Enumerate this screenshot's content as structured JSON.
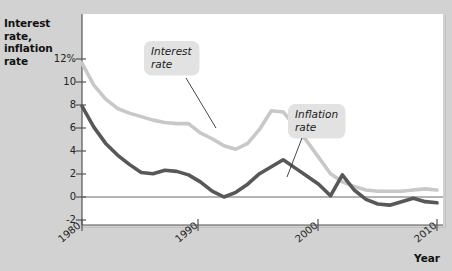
{
  "figure": {
    "y_axis_title_line1": "Interest rate,",
    "y_axis_title_line2": "inflation rate",
    "x_axis_title": "Year"
  },
  "callouts": {
    "interest": {
      "line1": "Interest",
      "line2": "rate"
    },
    "inflation": {
      "line1": "Inflation",
      "line2": "rate"
    }
  },
  "ticks": {
    "y": [
      "12%",
      "10",
      "8",
      "6",
      "4",
      "2",
      "0",
      "-2"
    ],
    "x": [
      "1980",
      "1990",
      "2000",
      "2010"
    ]
  },
  "colors": {
    "interest_rate_line": "#c8c8c8",
    "inflation_rate_line": "#585858",
    "panel_background": "#ffffff",
    "page_background": "#d2d2d2",
    "callout_background": "#e2e2e2",
    "axis": "#555555"
  },
  "chart_data": {
    "type": "line",
    "title": "",
    "xlabel": "Year",
    "ylabel": "Interest rate, inflation rate",
    "xlim": [
      1980,
      2010
    ],
    "ylim": [
      -2,
      12
    ],
    "ytick_labels": [
      "12%",
      "10",
      "8",
      "6",
      "4",
      "2",
      "0",
      "-2"
    ],
    "ytick_values": [
      12,
      10,
      8,
      6,
      4,
      2,
      0,
      -2
    ],
    "xtick_values": [
      1980,
      1990,
      2000,
      2010
    ],
    "grid": false,
    "legend": "callout-labels",
    "zero_line": 0,
    "x": [
      1980,
      1981,
      1982,
      1983,
      1984,
      1985,
      1986,
      1987,
      1988,
      1989,
      1990,
      1991,
      1992,
      1993,
      1994,
      1995,
      1996,
      1997,
      1998,
      1999,
      2000,
      2001,
      2002,
      2003,
      2004,
      2005,
      2006,
      2007,
      2008,
      2009,
      2010
    ],
    "series": [
      {
        "name": "Interest rate",
        "color": "#c8c8c8",
        "values": [
          11.5,
          9.6,
          8.4,
          7.6,
          7.2,
          6.9,
          6.6,
          6.4,
          6.3,
          6.3,
          5.5,
          5.0,
          4.4,
          4.1,
          4.6,
          5.8,
          7.4,
          7.3,
          6.1,
          4.8,
          3.4,
          2.0,
          1.3,
          0.9,
          0.6,
          0.5,
          0.5,
          0.5,
          0.6,
          0.7,
          0.6
        ]
      },
      {
        "name": "Inflation rate",
        "color": "#585858",
        "values": [
          7.8,
          6.0,
          4.6,
          3.6,
          2.8,
          2.1,
          2.0,
          2.3,
          2.2,
          1.9,
          1.3,
          0.5,
          0.0,
          0.4,
          1.1,
          2.0,
          2.6,
          3.2,
          2.5,
          1.8,
          1.1,
          0.1,
          1.9,
          0.6,
          -0.2,
          -0.6,
          -0.7,
          -0.4,
          -0.1,
          -0.4,
          -0.5
        ]
      }
    ],
    "annotations": [
      {
        "text": "Interest rate",
        "points_to_year": 1995
      },
      {
        "text": "Inflation rate",
        "points_to_year": 1999
      }
    ]
  }
}
